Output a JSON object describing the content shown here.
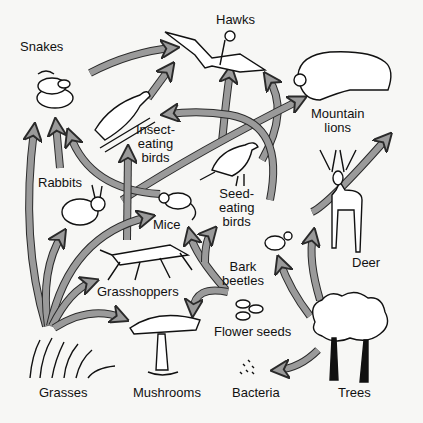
{
  "diagram": {
    "type": "food-web",
    "colors": {
      "arrow_fill": "#9a9a9a",
      "arrow_stroke": "#2a2a2a",
      "line_art": "#111111",
      "background": "#f7f7f5"
    },
    "organisms": [
      {
        "id": "snakes",
        "label": "Snakes",
        "icon": "snake-icon"
      },
      {
        "id": "hawks",
        "label": "Hawks",
        "icon": "hawk-icon"
      },
      {
        "id": "mountain_lions",
        "label": "Mountain\nlions",
        "icon": "mountain-lion-icon"
      },
      {
        "id": "insect_eating_birds",
        "label": "Insect-\neating\nbirds",
        "icon": "insect-eating-bird-icon"
      },
      {
        "id": "rabbits",
        "label": "Rabbits",
        "icon": "rabbit-icon"
      },
      {
        "id": "mice",
        "label": "Mice",
        "icon": "mouse-icon"
      },
      {
        "id": "seed_eating_birds",
        "label": "Seed-\neating\nbirds",
        "icon": "seed-eating-bird-icon"
      },
      {
        "id": "deer",
        "label": "Deer",
        "icon": "deer-icon"
      },
      {
        "id": "grasshoppers",
        "label": "Grasshoppers",
        "icon": "grasshopper-icon"
      },
      {
        "id": "bark_beetles",
        "label": "Bark\nbeetles",
        "icon": "beetle-icon"
      },
      {
        "id": "flower_seeds",
        "label": "Flower seeds",
        "icon": "seeds-icon"
      },
      {
        "id": "grasses",
        "label": "Grasses",
        "icon": "grass-icon"
      },
      {
        "id": "mushrooms",
        "label": "Mushrooms",
        "icon": "mushroom-icon"
      },
      {
        "id": "bacteria",
        "label": "Bacteria",
        "icon": "bacteria-icon"
      },
      {
        "id": "trees",
        "label": "Trees",
        "icon": "tree-icon"
      }
    ],
    "edges": [
      {
        "from": "snakes",
        "to": "hawks"
      },
      {
        "from": "insect_eating_birds",
        "to": "hawks"
      },
      {
        "from": "seed_eating_birds",
        "to": "hawks"
      },
      {
        "from": "rabbits",
        "to": "hawks"
      },
      {
        "from": "mice",
        "to": "mountain_lions"
      },
      {
        "from": "rabbits",
        "to": "snakes"
      },
      {
        "from": "grasses",
        "to": "snakes"
      },
      {
        "from": "mice",
        "to": "snakes"
      },
      {
        "from": "grasshoppers",
        "to": "insect_eating_birds"
      },
      {
        "from": "bark_beetles",
        "to": "insect_eating_birds"
      },
      {
        "from": "grasses",
        "to": "rabbits"
      },
      {
        "from": "grasses",
        "to": "mice"
      },
      {
        "from": "grasses",
        "to": "grasshoppers"
      },
      {
        "from": "grasses",
        "to": "mushrooms"
      },
      {
        "from": "flower_seeds",
        "to": "mice"
      },
      {
        "from": "flower_seeds",
        "to": "seed_eating_birds"
      },
      {
        "from": "flower_seeds",
        "to": "mushrooms"
      },
      {
        "from": "trees",
        "to": "bark_beetles"
      },
      {
        "from": "trees",
        "to": "deer"
      },
      {
        "from": "trees",
        "to": "bacteria"
      },
      {
        "from": "deer",
        "to": "mountain_lions"
      }
    ]
  }
}
